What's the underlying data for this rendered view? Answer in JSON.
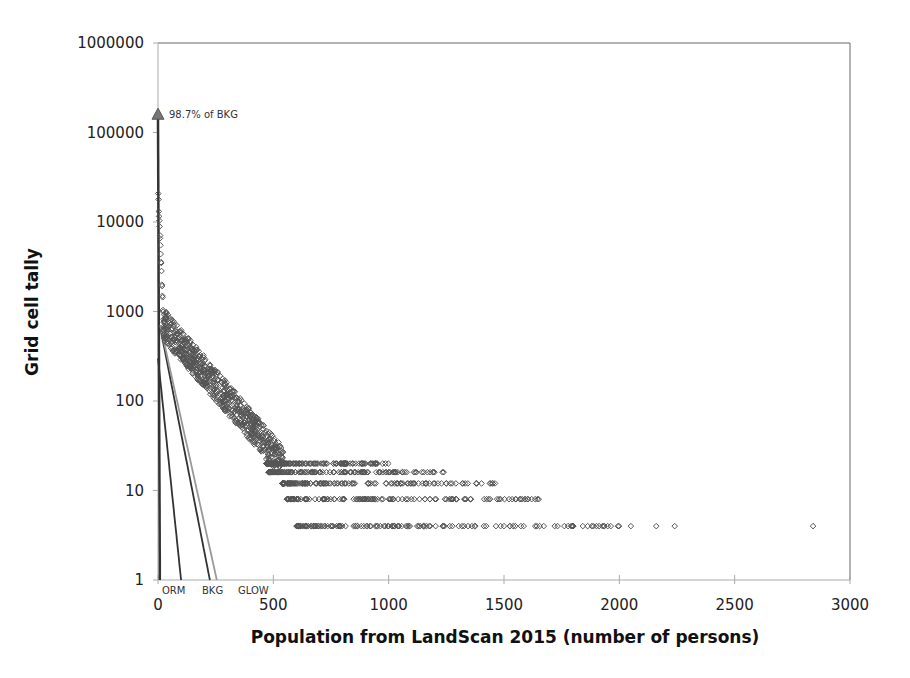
{
  "chart_data": {
    "type": "scatter",
    "title": "",
    "xlabel": "Population from LandScan 2015 (number of persons)",
    "ylabel": "Grid cell tally",
    "xlim": [
      0,
      3000
    ],
    "ylim": [
      1,
      1000000
    ],
    "yscale": "log",
    "grid": false,
    "x_ticks": [
      0,
      500,
      1000,
      1500,
      2000,
      2500,
      3000
    ],
    "y_ticks": [
      1,
      10,
      100,
      1000,
      10000,
      100000,
      1000000
    ],
    "y_tick_labels": [
      "1",
      "10",
      "100",
      "1000",
      "10000",
      "100000",
      "1000000"
    ],
    "annotation": {
      "text": "98.7% of BKG",
      "x": 0,
      "y": 160000,
      "marker": "triangle"
    },
    "curve_labels": [
      "ORM",
      "BKG",
      "GLOW"
    ],
    "series": [
      {
        "name": "LandScan tally",
        "marker": "open-diamond",
        "points_desc": "Steep decline from ~24000 at x≈0 to ~800 at x≈20; then gradual decline ~600 at x=30, ~200 at x=150, ~100 at x=280, ~40 at x=430, ~20 at x=520; discrete bands at y=20 (to ~1000), 16 (to ~1250), 12 (to ~1470), 8 (to ~1650), 4 (600–2840)",
        "outliers": [
          {
            "x": 2840,
            "y": 4
          },
          {
            "x": 2240,
            "y": 4
          },
          {
            "x": 2160,
            "y": 4
          },
          {
            "x": 2050,
            "y": 4
          },
          {
            "x": 1650,
            "y": 8
          },
          {
            "x": 1470,
            "y": 8
          },
          {
            "x": 1250,
            "y": 12
          },
          {
            "x": 1320,
            "y": 12
          }
        ]
      },
      {
        "name": "ORM",
        "type": "line",
        "from": [
          0,
          300
        ],
        "to": [
          100,
          1
        ]
      },
      {
        "name": "BKG",
        "type": "line",
        "from": [
          0,
          160000
        ],
        "to": [
          225,
          1
        ]
      },
      {
        "name": "GLOW",
        "type": "line",
        "from": [
          0,
          700
        ],
        "to": [
          250,
          1
        ]
      }
    ]
  }
}
